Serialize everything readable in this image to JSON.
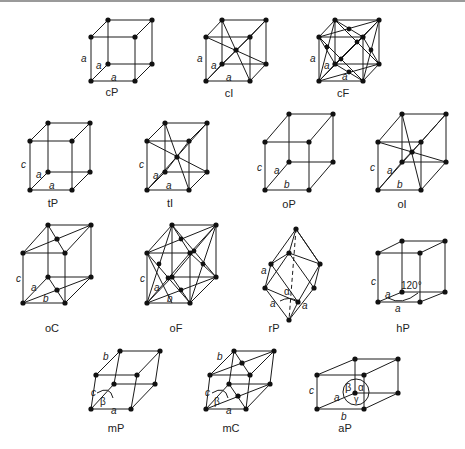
{
  "figure": {
    "lattices": [
      {
        "id": "cP",
        "name": "cP",
        "edge_labels": [
          "a",
          "a",
          "a"
        ]
      },
      {
        "id": "cI",
        "name": "cI",
        "edge_labels": [
          "a",
          "a",
          "a"
        ]
      },
      {
        "id": "cF",
        "name": "cF",
        "edge_labels": [
          "a",
          "a",
          "a"
        ]
      },
      {
        "id": "tP",
        "name": "tP",
        "edge_labels": [
          "c",
          "a",
          "a"
        ]
      },
      {
        "id": "tI",
        "name": "tI",
        "edge_labels": [
          "c",
          "a",
          "a"
        ]
      },
      {
        "id": "oP",
        "name": "oP",
        "edge_labels": [
          "c",
          "a",
          "b"
        ]
      },
      {
        "id": "oI",
        "name": "oI",
        "edge_labels": [
          "c",
          "a",
          "b"
        ]
      },
      {
        "id": "oC",
        "name": "oC",
        "edge_labels": [
          "c",
          "a",
          "b"
        ]
      },
      {
        "id": "oF",
        "name": "oF",
        "edge_labels": [
          "c",
          "a",
          "b"
        ]
      },
      {
        "id": "rP",
        "name": "rP",
        "edge_labels": [
          "a",
          "a",
          "a"
        ],
        "angle_label": "α"
      },
      {
        "id": "hP",
        "name": "hP",
        "edge_labels": [
          "c",
          "a",
          "a"
        ],
        "angle_label": "120°"
      },
      {
        "id": "mP",
        "name": "mP",
        "edge_labels": [
          "b",
          "c",
          "a"
        ],
        "angle_label": "β"
      },
      {
        "id": "mC",
        "name": "mC",
        "edge_labels": [
          "b",
          "c",
          "a"
        ],
        "angle_label": "β"
      },
      {
        "id": "aP",
        "name": "aP",
        "edge_labels": [
          "c",
          "a",
          "b"
        ],
        "angle_labels": [
          "β",
          "α",
          "γ"
        ]
      }
    ]
  }
}
